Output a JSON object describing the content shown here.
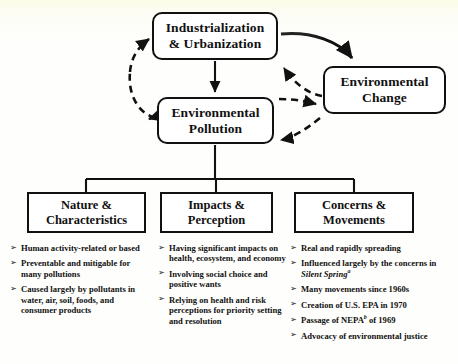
{
  "diagram": {
    "colors": {
      "line": "#111111",
      "box_fill": "#ffffff",
      "background": "#fefefc"
    },
    "nodes": {
      "industrialization": "Industrialization\n& Urbanization",
      "industrialization_line1": "Industrialization",
      "industrialization_line2": "& Urbanization",
      "environmental_change_line1": "Environmental",
      "environmental_change_line2": "Change",
      "environmental_pollution_line1": "Environmental",
      "environmental_pollution_line2": "Pollution"
    },
    "categories": [
      {
        "key": "nature",
        "line1": "Nature &",
        "line2": "Characteristics",
        "bullets": [
          "Human activity-related or based",
          "Preventable and mitigable for many pollutions",
          "Caused largely by pollutants in water, air, soil, foods, and consumer products"
        ]
      },
      {
        "key": "impacts",
        "line1": "Impacts &",
        "line2": "Perception",
        "bullets": [
          "Having significant impacts on health, ecosystem, and economy",
          "Involving social choice and positive wants",
          "Relying on health and risk perceptions for priority setting and resolution"
        ]
      },
      {
        "key": "concerns",
        "line1": "Concerns &",
        "line2": "Movements",
        "bullets": [
          "Real and rapidly spreading",
          "Influenced largely by the concerns in Silent Spring",
          "Many movements since 1960s",
          "Creation of U.S. EPA in 1970",
          "Passage of NEPA of 1969",
          "Advocacy of environmental justice"
        ],
        "bullet_notes": {
          "silent_spring_title": "Silent Spring",
          "silent_spring_footnote": "a",
          "nepa_footnote": "b"
        }
      }
    ],
    "edges": [
      {
        "from": "Industrialization & Urbanization",
        "to": "Environmental Pollution",
        "style": "solid",
        "direction": "one-way"
      },
      {
        "from": "Industrialization & Urbanization",
        "to": "Environmental Change",
        "style": "solid",
        "direction": "one-way"
      },
      {
        "from": "Environmental Change",
        "to": "Industrialization & Urbanization",
        "style": "dashed",
        "direction": "one-way"
      },
      {
        "from": "Environmental Pollution",
        "to": "Industrialization & Urbanization",
        "style": "dashed",
        "direction": "two-way"
      },
      {
        "from": "Environmental Pollution",
        "to": "Environmental Change",
        "style": "dashed",
        "direction": "two-way"
      },
      {
        "from": "Environmental Pollution",
        "to": "Nature & Characteristics",
        "style": "solid",
        "direction": "tree"
      },
      {
        "from": "Environmental Pollution",
        "to": "Impacts & Perception",
        "style": "solid",
        "direction": "tree"
      },
      {
        "from": "Environmental Pollution",
        "to": "Concerns & Movements",
        "style": "solid",
        "direction": "tree"
      }
    ]
  }
}
